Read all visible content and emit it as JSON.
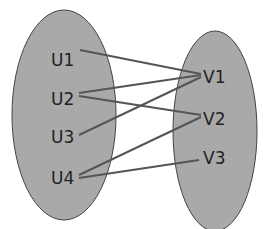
{
  "diagram": {
    "type": "bipartite-graph",
    "left_set": {
      "fill": "#a9a9a9",
      "nodes": [
        {
          "id": "U1",
          "label": "U1"
        },
        {
          "id": "U2",
          "label": "U2"
        },
        {
          "id": "U3",
          "label": "U3"
        },
        {
          "id": "U4",
          "label": "U4"
        }
      ]
    },
    "right_set": {
      "fill": "#a9a9a9",
      "nodes": [
        {
          "id": "V1",
          "label": "V1"
        },
        {
          "id": "V2",
          "label": "V2"
        },
        {
          "id": "V3",
          "label": "V3"
        }
      ]
    },
    "edges": [
      {
        "from": "U1",
        "to": "V1"
      },
      {
        "from": "U2",
        "to": "V1"
      },
      {
        "from": "U2",
        "to": "V2"
      },
      {
        "from": "U3",
        "to": "V1"
      },
      {
        "from": "U4",
        "to": "V2"
      },
      {
        "from": "U4",
        "to": "V3"
      }
    ],
    "edge_color": "#555555"
  }
}
